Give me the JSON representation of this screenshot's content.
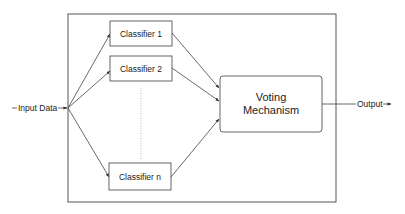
{
  "diagram": {
    "type": "ensemble-voting-flow",
    "input": {
      "label": "Input Data"
    },
    "classifiers": [
      {
        "id": "c1",
        "label": "Classifier 1"
      },
      {
        "id": "c2",
        "label": "Classifier 2"
      },
      {
        "id": "cn",
        "label": "Classifier n"
      }
    ],
    "ellipsis": "dotted vertical line between Classifier 2 and Classifier n",
    "aggregator": {
      "label_line1": "Voting",
      "label_line2": "Mechanism"
    },
    "output": {
      "label": "Output"
    },
    "edges": [
      {
        "from": "input",
        "to": "c1"
      },
      {
        "from": "input",
        "to": "c2"
      },
      {
        "from": "input",
        "to": "cn"
      },
      {
        "from": "c1",
        "to": "aggregator"
      },
      {
        "from": "c2",
        "to": "aggregator"
      },
      {
        "from": "cn",
        "to": "aggregator"
      },
      {
        "from": "aggregator",
        "to": "output"
      }
    ]
  },
  "colors": {
    "stroke": "#444444",
    "frame": "#555555",
    "text": "#222222",
    "dotted": "#aaaaaa",
    "background": "#ffffff"
  }
}
